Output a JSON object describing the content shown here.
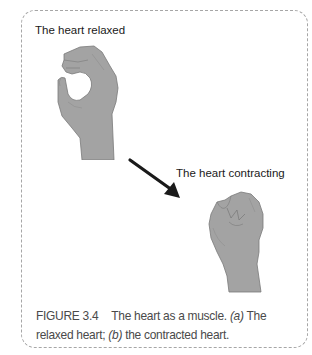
{
  "figure": {
    "label_relaxed": "The heart relaxed",
    "label_contracting": "The heart contracting",
    "caption": {
      "number": "FIGURE 3.4",
      "text_1": "The heart as a muscle. ",
      "italic_a": "(a)",
      "text_2": " The relaxed heart; ",
      "italic_b": "(b)",
      "text_3": " the contracted heart."
    },
    "illustrations": [
      {
        "name": "open-hand",
        "represents": "relaxed heart"
      },
      {
        "name": "arrow",
        "direction": "down-right"
      },
      {
        "name": "closed-fist",
        "represents": "contracting heart"
      }
    ],
    "colors": {
      "hand_fill": "#a3a3a3",
      "hand_stroke": "#7a7a7a",
      "arrow": "#1a1a1a",
      "border": "#a6a6a6",
      "caption_text": "#4a4a4a"
    }
  }
}
